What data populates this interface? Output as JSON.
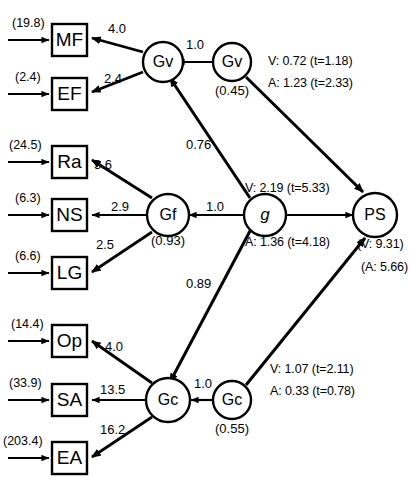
{
  "figure": {
    "type": "structural-equation-model-path-diagram",
    "background": "#ffffff",
    "stroke": "#000000"
  },
  "indicators": [
    {
      "id": "MF",
      "label": "MF",
      "residual": "(19.8)",
      "loading": "4.0",
      "factor": "Gv"
    },
    {
      "id": "EF",
      "label": "EF",
      "residual": "(2.4)",
      "loading": "2.4",
      "factor": "Gv"
    },
    {
      "id": "Ra",
      "label": "Ra",
      "residual": "(24.5)",
      "loading": "3.6",
      "factor": "Gf"
    },
    {
      "id": "NS",
      "label": "NS",
      "residual": "(6.3)",
      "loading": "2.9",
      "factor": "Gf"
    },
    {
      "id": "LG",
      "label": "LG",
      "residual": "(6.6)",
      "loading": "2.5",
      "factor": "Gf"
    },
    {
      "id": "Op",
      "label": "Op",
      "residual": "(14.4)",
      "loading": "4.0",
      "factor": "Gc"
    },
    {
      "id": "SA",
      "label": "SA",
      "residual": "(33.9)",
      "loading": "13.5",
      "factor": "Gc"
    },
    {
      "id": "EA",
      "label": "EA",
      "residual": "(203.4)",
      "loading": "16.2",
      "factor": "Gc"
    }
  ],
  "factors": [
    {
      "id": "Gv",
      "label": "Gv",
      "disturbance": null
    },
    {
      "id": "Gf",
      "label": "Gf",
      "disturbance": "(0.93)"
    },
    {
      "id": "Gc",
      "label": "Gc",
      "disturbance": null
    }
  ],
  "disturbances": [
    {
      "id": "Gv-d",
      "label": "Gv",
      "value": "(0.45)",
      "path": "1.0"
    },
    {
      "id": "Gc-d",
      "label": "Gc",
      "value": "(0.55)",
      "path": "1.0"
    }
  ],
  "g_factor": {
    "label": "g"
  },
  "outcome": {
    "label": "PS",
    "residual_v": "(V: 9.31)",
    "residual_a": "(A: 5.66)"
  },
  "g_paths": [
    {
      "target": "Gv",
      "value": "0.76"
    },
    {
      "target": "Gf",
      "value": "1.0"
    },
    {
      "target": "Gc",
      "value": "0.89"
    }
  ],
  "structural_paths": [
    {
      "from": "Gv",
      "to": "PS",
      "line_v": "V: 0.72 (t=1.18)",
      "line_a": "A: 1.23 (t=2.33)"
    },
    {
      "from": "g",
      "to": "PS",
      "line_v": "V: 2.19 (t=5.33)",
      "line_a": "A: 1.36 (t=4.18)"
    },
    {
      "from": "Gc",
      "to": "PS",
      "line_v": "V: 1.07 (t=2.11)",
      "line_a": "A: 0.33 (t=0.78)"
    }
  ]
}
